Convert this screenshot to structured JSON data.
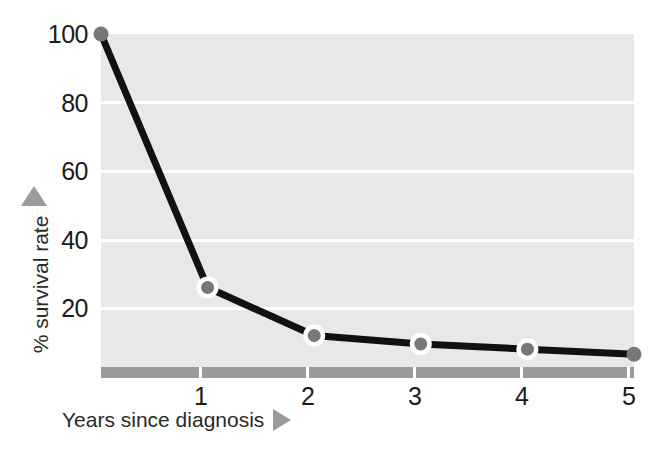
{
  "chart_data": {
    "type": "line",
    "title": "",
    "subtitle": "",
    "xlabel": "Years since diagnosis",
    "ylabel": "% survival rate",
    "x": [
      0,
      1,
      2,
      3,
      4,
      5
    ],
    "values": [
      100,
      26,
      12,
      9.5,
      8,
      6.5
    ],
    "series": [
      {
        "name": "% survival rate",
        "values": [
          100,
          26,
          12,
          9.5,
          8,
          6.5
        ]
      }
    ],
    "x_tick_labels": [
      "1",
      "2",
      "3",
      "4",
      "5"
    ],
    "x_tick_values": [
      1,
      2,
      3,
      4,
      5
    ],
    "y_tick_labels": [
      "100",
      "80",
      "60",
      "40",
      "20"
    ],
    "y_tick_values": [
      100,
      80,
      60,
      40,
      20
    ],
    "xlim": [
      0,
      5
    ],
    "ylim": [
      0,
      100
    ],
    "grid": "horizontal",
    "legend": "none",
    "annotations": [],
    "colors": {
      "plot_background": "#e7e8e8",
      "gridline": "#ffffff",
      "line": "#111111",
      "marker_ring": "#ffffff",
      "marker_core": "#777777",
      "axis_bar": "#9b9b9b",
      "axis_arrow": "#9b9b9b",
      "tick_label": "#1b1b1b",
      "axis_title": "#2a2a2a",
      "page_background": "#ffffff"
    }
  },
  "axes": {
    "y": {
      "title": "% survival rate",
      "arrow_icon": "triangle-up-icon",
      "ticks": [
        {
          "label": "100"
        },
        {
          "label": "80"
        },
        {
          "label": "60"
        },
        {
          "label": "40"
        },
        {
          "label": "20"
        }
      ]
    },
    "x": {
      "title": "Years since diagnosis",
      "arrow_icon": "triangle-right-icon",
      "ticks": [
        {
          "label": "1"
        },
        {
          "label": "2"
        },
        {
          "label": "3"
        },
        {
          "label": "4"
        },
        {
          "label": "5"
        }
      ]
    }
  }
}
